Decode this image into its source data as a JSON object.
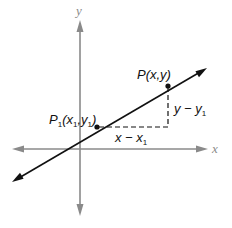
{
  "diagram": {
    "type": "coordinate-geometry",
    "axes": {
      "x_label": "x",
      "y_label": "y",
      "color": "#8a8a8a"
    },
    "line": {
      "color": "#111111",
      "description": "line through P1 and P with arrows on both ends"
    },
    "points": {
      "p1": {
        "name": "P",
        "sub": "1",
        "open": "(x",
        "x_sub": "1",
        "comma": ",y",
        "y_sub": "1",
        "close": ")"
      },
      "p": {
        "label": "P(x,y)"
      }
    },
    "legs": {
      "horizontal": {
        "main": "x − x",
        "sub": "1"
      },
      "vertical": {
        "main": "y − y",
        "sub": "1"
      }
    }
  }
}
